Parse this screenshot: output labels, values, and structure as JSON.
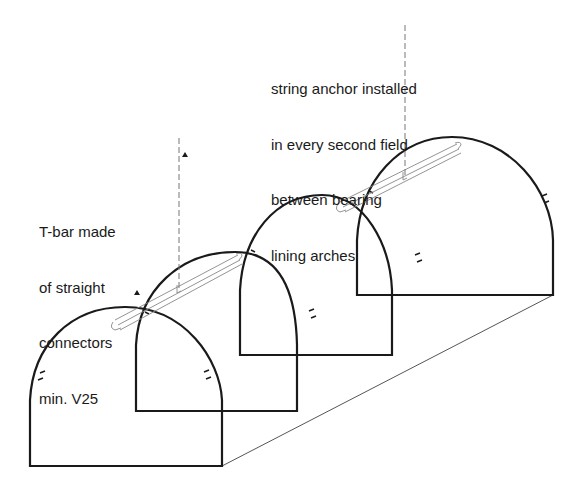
{
  "diagram": {
    "annotations": {
      "string_anchor": {
        "lines": [
          "string anchor installed",
          "in every second field",
          "between bearing",
          "lining arches"
        ]
      },
      "t_bar": {
        "lines": [
          "T-bar made",
          "of straight",
          "connectors",
          "min. V25"
        ]
      }
    },
    "elements": {
      "arches": 4,
      "t_bar_connectors": 2,
      "dashed_leader_lines": 2
    },
    "colors": {
      "stroke": "#1a1a1a",
      "connector": "#888888",
      "background": "#ffffff"
    }
  }
}
